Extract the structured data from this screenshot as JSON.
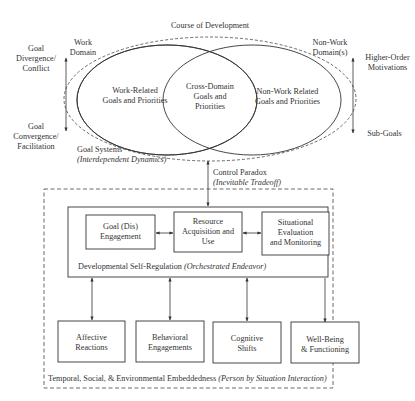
{
  "title": "Course of Development",
  "domains": {
    "work": {
      "label_line1": "Work",
      "label_line2": "Domain",
      "content_line1": "Work-Related",
      "content_line2": "Goals and Priorities"
    },
    "cross": {
      "line1": "Cross-Domain",
      "line2": "Goals and",
      "line3": "Priorities"
    },
    "nonwork": {
      "label_line1": "Non-Work",
      "label_line2": "Domain(s)",
      "content_line1": "Non-Work Related",
      "content_line2": "Goals and Priorities"
    }
  },
  "left_axis": {
    "top_line1": "Goal",
    "top_line2": "Divergence/",
    "top_line3": "Conflict",
    "bottom_line1": "Goal",
    "bottom_line2": "Convergence/",
    "bottom_line3": "Facilitation"
  },
  "right_axis": {
    "top_line1": "Higher-Order",
    "top_line2": "Motivations",
    "bottom": "Sub-Goals"
  },
  "goal_systems": {
    "line1": "Goal Systems",
    "line2": "(Interdependent Dynamics)"
  },
  "control_paradox": {
    "line1": "Control Paradox",
    "line2": "(Inevitable Tradeoff)"
  },
  "self_regulation": {
    "caption": "Developmental Self-Regulation",
    "caption_italic": "(Orchestrated Endeavor)",
    "boxes": [
      {
        "line1": "Goal (Dis)",
        "line2": "Engagement",
        "line3": ""
      },
      {
        "line1": "Resource",
        "line2": "Acquisition and",
        "line3": "Use"
      },
      {
        "line1": "Situational",
        "line2": "Evaluation",
        "line3": "and Monitoring"
      }
    ]
  },
  "outcomes": [
    {
      "line1": "Affective",
      "line2": "Reactions"
    },
    {
      "line1": "Behavioral",
      "line2": "Engagements"
    },
    {
      "line1": "Cognitive",
      "line2": "Shifts"
    },
    {
      "line1": "Well-Being",
      "line2": "& Functioning"
    }
  ],
  "embeddedness": {
    "caption": "Temporal, Social, & Environmental Embeddedness",
    "caption_italic": "(Person by Situation Interaction)"
  },
  "colors": {
    "stroke": "#3a3a3a",
    "text": "#333333",
    "background": "#ffffff"
  }
}
